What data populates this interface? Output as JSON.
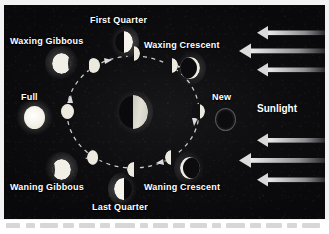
{
  "figure": {
    "background_color": "#0d0d10",
    "panel_border_color": "#f2f2f2"
  },
  "labels": {
    "first_quarter": "First Quarter",
    "waxing_gibbous": "Waxing Gibbous",
    "waxing_crescent": "Waxing Crescent",
    "full": "Full",
    "new": "New",
    "waning_gibbous": "Waning Gibbous",
    "waning_crescent": "Waning Crescent",
    "last_quarter": "Last Quarter",
    "sunlight": "Sunlight"
  },
  "colors": {
    "moon_lit": "#f6f4ec",
    "moon_dark": "#0a0a0c",
    "moon_rim": "#4a4a4e",
    "orbit_dash": "#d8d8d8",
    "arrow": "#cfcfcf",
    "earth_lit": "#d8d6cc",
    "text": "#ffffff"
  },
  "diagram": {
    "type": "moon-phase-orbit",
    "center_body": "Earth",
    "center_body_illumination": "right-half-lit",
    "sunlight_direction": "right-to-left",
    "orbit_direction": "counterclockwise",
    "outer_phases": [
      {
        "id": "first-quarter",
        "label": "First Quarter",
        "angle_deg": 90,
        "illuminated_fraction": 0.5,
        "lit_side": "right"
      },
      {
        "id": "waxing-gibbous",
        "label": "Waxing Gibbous",
        "angle_deg": 135,
        "illuminated_fraction": 0.9,
        "lit_side": "right"
      },
      {
        "id": "full",
        "label": "Full",
        "angle_deg": 180,
        "illuminated_fraction": 1.0,
        "lit_side": "full"
      },
      {
        "id": "waning-gibbous",
        "label": "Waning Gibbous",
        "angle_deg": 225,
        "illuminated_fraction": 0.9,
        "lit_side": "left"
      },
      {
        "id": "last-quarter",
        "label": "Last Quarter",
        "angle_deg": 270,
        "illuminated_fraction": 0.5,
        "lit_side": "left"
      },
      {
        "id": "waning-crescent",
        "label": "Waning Crescent",
        "angle_deg": 315,
        "illuminated_fraction": 0.12,
        "lit_side": "left"
      },
      {
        "id": "new",
        "label": "New",
        "angle_deg": 0,
        "illuminated_fraction": 0.0,
        "lit_side": "none"
      },
      {
        "id": "waxing-crescent",
        "label": "Waxing Crescent",
        "angle_deg": 45,
        "illuminated_fraction": 0.12,
        "lit_side": "right"
      }
    ],
    "orbit_positions": [
      {
        "id": "orbit-first-quarter",
        "angle_deg": 90,
        "illuminated_fraction": 0.5,
        "lit_side": "right"
      },
      {
        "id": "orbit-waxing-gibbous",
        "angle_deg": 135,
        "illuminated_fraction": 0.85,
        "lit_side": "right"
      },
      {
        "id": "orbit-full",
        "angle_deg": 180,
        "illuminated_fraction": 1.0,
        "lit_side": "full"
      },
      {
        "id": "orbit-waning-gibbous",
        "angle_deg": 225,
        "illuminated_fraction": 0.85,
        "lit_side": "left"
      },
      {
        "id": "orbit-last-quarter",
        "angle_deg": 270,
        "illuminated_fraction": 0.5,
        "lit_side": "left"
      },
      {
        "id": "orbit-waning-crescent",
        "angle_deg": 315,
        "illuminated_fraction": 0.2,
        "lit_side": "left"
      },
      {
        "id": "orbit-new",
        "angle_deg": 0,
        "illuminated_fraction": 0.08,
        "lit_side": "right"
      },
      {
        "id": "orbit-waxing-crescent",
        "angle_deg": 45,
        "illuminated_fraction": 0.2,
        "lit_side": "right"
      }
    ],
    "sunlight_rays": [
      {
        "id": "ray-1",
        "length": 60
      },
      {
        "id": "ray-2",
        "length": 78
      },
      {
        "id": "ray-3",
        "length": 60
      },
      {
        "id": "ray-4",
        "length": 60
      },
      {
        "id": "ray-5",
        "length": 78
      },
      {
        "id": "ray-6",
        "length": 60
      }
    ]
  }
}
